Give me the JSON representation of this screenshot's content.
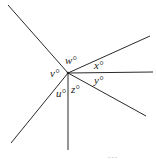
{
  "diagram": {
    "type": "angles-at-a-point",
    "center": {
      "x": 68,
      "y": 73
    },
    "rays": [
      {
        "name": "ray-upper-left",
        "x2": 8,
        "y2": 5
      },
      {
        "name": "ray-upper-right",
        "x2": 150,
        "y2": 36
      },
      {
        "name": "ray-right",
        "x2": 153,
        "y2": 72
      },
      {
        "name": "ray-lower-right",
        "x2": 146,
        "y2": 116
      },
      {
        "name": "ray-down",
        "x2": 68,
        "y2": 150
      },
      {
        "name": "ray-lower-left",
        "x2": 11,
        "y2": 143
      }
    ],
    "labels": [
      {
        "name": "angle-label-w",
        "text": "w°",
        "x": 65,
        "y": 64
      },
      {
        "name": "angle-label-x",
        "text": "x°",
        "x": 94,
        "y": 69
      },
      {
        "name": "angle-label-v",
        "text": "v°",
        "x": 50,
        "y": 77
      },
      {
        "name": "angle-label-y",
        "text": "y°",
        "x": 94,
        "y": 84
      },
      {
        "name": "angle-label-u",
        "text": "u°",
        "x": 56,
        "y": 97
      },
      {
        "name": "angle-label-z",
        "text": "z°",
        "x": 71,
        "y": 93
      }
    ],
    "footer_fragment": "- - -"
  }
}
